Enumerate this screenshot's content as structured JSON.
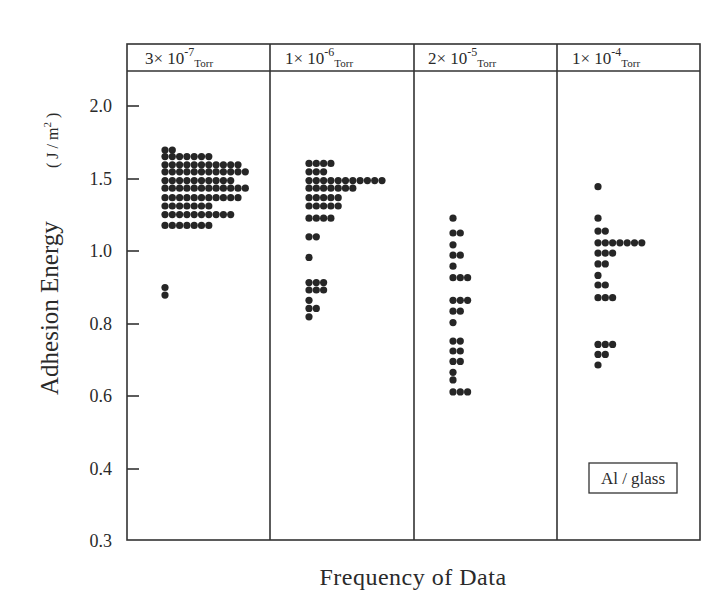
{
  "chart_data": {
    "type": "scatter",
    "subtype": "dot-histogram",
    "title": "",
    "xlabel": "Frequency of Data",
    "ylabel": "Adhesion Energy",
    "ylabel_unit": "(J / m²)",
    "ylim": [
      0.3,
      2.2
    ],
    "yscale": "log",
    "yticks": [
      0.3,
      0.4,
      0.6,
      0.8,
      1.0,
      1.5,
      2.0
    ],
    "ytick_labels": [
      "0.3",
      "0.4",
      "0.6",
      "0.8",
      "1.0",
      "1.5",
      "2.0"
    ],
    "grid": false,
    "annotation": "Al / glass",
    "panels": [
      {
        "label": "3×10^-7 Torr",
        "coef": "3×",
        "base": "10",
        "exp": "-7",
        "unit": "Torr",
        "rows": [
          {
            "y": 1.62,
            "count": 2
          },
          {
            "y": 1.57,
            "count": 7
          },
          {
            "y": 1.51,
            "count": 11
          },
          {
            "y": 1.46,
            "count": 12
          },
          {
            "y": 1.4,
            "count": 10
          },
          {
            "y": 1.35,
            "count": 12
          },
          {
            "y": 1.29,
            "count": 11
          },
          {
            "y": 1.24,
            "count": 7
          },
          {
            "y": 1.19,
            "count": 10
          },
          {
            "y": 1.13,
            "count": 7
          },
          {
            "y": 0.84,
            "count": 1
          },
          {
            "y": 0.81,
            "count": 1
          }
        ]
      },
      {
        "label": "1×10^-6 Torr",
        "coef": "1×",
        "base": "10",
        "exp": "-6",
        "unit": "Torr",
        "rows": [
          {
            "y": 1.52,
            "count": 4
          },
          {
            "y": 1.46,
            "count": 3
          },
          {
            "y": 1.4,
            "count": 11
          },
          {
            "y": 1.35,
            "count": 7
          },
          {
            "y": 1.29,
            "count": 5
          },
          {
            "y": 1.24,
            "count": 5
          },
          {
            "y": 1.17,
            "count": 4
          },
          {
            "y": 1.07,
            "count": 2
          },
          {
            "y": 0.97,
            "count": 1
          },
          {
            "y": 0.86,
            "count": 3
          },
          {
            "y": 0.83,
            "count": 3
          },
          {
            "y": 0.79,
            "count": 1
          },
          {
            "y": 0.76,
            "count": 2
          },
          {
            "y": 0.73,
            "count": 1
          }
        ]
      },
      {
        "label": "2×10^-5 Torr",
        "coef": "2×",
        "base": "10",
        "exp": "-5",
        "unit": "Torr",
        "rows": [
          {
            "y": 1.17,
            "count": 1
          },
          {
            "y": 1.09,
            "count": 2
          },
          {
            "y": 1.03,
            "count": 1
          },
          {
            "y": 0.98,
            "count": 2
          },
          {
            "y": 0.93,
            "count": 1
          },
          {
            "y": 0.88,
            "count": 3
          },
          {
            "y": 0.79,
            "count": 3
          },
          {
            "y": 0.75,
            "count": 2
          },
          {
            "y": 0.71,
            "count": 1
          },
          {
            "y": 0.65,
            "count": 2
          },
          {
            "y": 0.62,
            "count": 2
          },
          {
            "y": 0.59,
            "count": 2
          },
          {
            "y": 0.56,
            "count": 1
          },
          {
            "y": 0.54,
            "count": 1
          },
          {
            "y": 0.51,
            "count": 3
          }
        ]
      },
      {
        "label": "1×10^-4 Torr",
        "coef": "1×",
        "base": "10",
        "exp": "-4",
        "unit": "Torr",
        "rows": [
          {
            "y": 1.36,
            "count": 1
          },
          {
            "y": 1.17,
            "count": 1
          },
          {
            "y": 1.1,
            "count": 2
          },
          {
            "y": 1.04,
            "count": 7
          },
          {
            "y": 0.99,
            "count": 3
          },
          {
            "y": 0.94,
            "count": 2
          },
          {
            "y": 0.89,
            "count": 1
          },
          {
            "y": 0.85,
            "count": 2
          },
          {
            "y": 0.8,
            "count": 3
          },
          {
            "y": 0.64,
            "count": 3
          },
          {
            "y": 0.61,
            "count": 2
          },
          {
            "y": 0.58,
            "count": 1
          }
        ]
      }
    ]
  },
  "header": {
    "panels": [
      {
        "coef": "3×",
        "base": " 10",
        "exp": "-7",
        "unit": "Torr"
      },
      {
        "coef": "1×",
        "base": " 10",
        "exp": "-6",
        "unit": "Torr"
      },
      {
        "coef": "2×",
        "base": " 10",
        "exp": "-5",
        "unit": "Torr"
      },
      {
        "coef": "1×",
        "base": " 10",
        "exp": "-4",
        "unit": "Torr"
      }
    ]
  },
  "axes": {
    "ylabel": "Adhesion Energy",
    "yunit_prefix": "( J / m",
    "yunit_sup": "2",
    "yunit_suffix": " )",
    "xlabel": "Frequency of Data",
    "ytick_labels": [
      "2.0",
      "1.5",
      "1.0",
      "0.8",
      "0.6",
      "0.4",
      "0.3"
    ]
  },
  "legend": {
    "annotation": "Al / glass"
  }
}
